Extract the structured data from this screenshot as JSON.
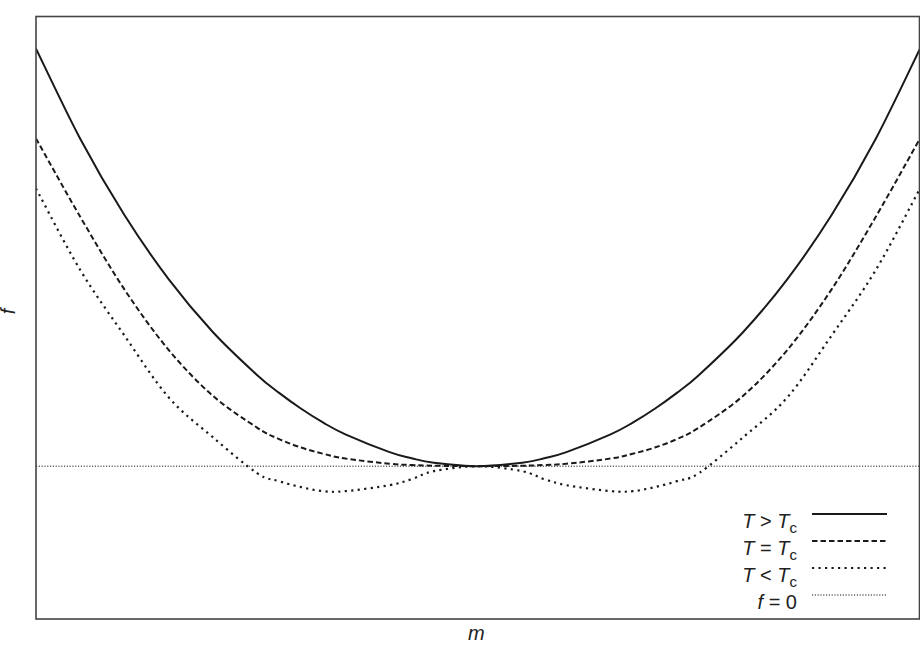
{
  "chart_data": {
    "type": "line",
    "title": "",
    "xlabel": "m",
    "ylabel": "f",
    "xlim": [
      -1.0,
      1.0
    ],
    "ylim": [
      -0.366,
      1.077
    ],
    "grid": false,
    "ticks": false,
    "legend_position": "lower right",
    "x": [
      -1.0,
      -0.9,
      -0.8,
      -0.7,
      -0.6,
      -0.5,
      -0.45,
      -0.4,
      -0.35,
      -0.3,
      -0.2,
      -0.15,
      -0.1,
      0.0,
      0.1,
      0.15,
      0.2,
      0.3,
      0.35,
      0.4,
      0.45,
      0.5,
      0.6,
      0.7,
      0.8,
      0.9,
      1.0
    ],
    "series": [
      {
        "name": "T > Tc",
        "style": "solid",
        "values": [
          1.0,
          0.7842,
          0.6014,
          0.4481,
          0.3215,
          0.2186,
          0.1755,
          0.1375,
          0.1042,
          0.0763,
          0.0336,
          0.0189,
          0.0083,
          0.0,
          0.0083,
          0.0189,
          0.0336,
          0.0763,
          0.1042,
          0.1375,
          0.1755,
          0.2186,
          0.3215,
          0.4481,
          0.6014,
          0.7842,
          1.0
        ]
      },
      {
        "name": "T = Tc",
        "style": "dashed",
        "values": [
          0.7847,
          0.5974,
          0.4234,
          0.2787,
          0.1687,
          0.0925,
          0.0649,
          0.0446,
          0.0297,
          0.0182,
          0.0058,
          0.0028,
          0.0011,
          0.0,
          0.0011,
          0.0028,
          0.0058,
          0.0182,
          0.0297,
          0.0446,
          0.0649,
          0.0925,
          0.1687,
          0.2787,
          0.4234,
          0.5974,
          0.7847
        ]
      },
      {
        "name": "T < Tc",
        "style": "dotted",
        "values": [
          0.665,
          0.47,
          0.313,
          0.165,
          0.0694,
          -0.0167,
          -0.0359,
          -0.0502,
          -0.0598,
          -0.0598,
          -0.0455,
          -0.031,
          -0.012,
          0.0,
          -0.012,
          -0.031,
          -0.0455,
          -0.0598,
          -0.0598,
          -0.0502,
          -0.0359,
          -0.0167,
          0.0694,
          0.165,
          0.313,
          0.47,
          0.665
        ]
      },
      {
        "name": "f = 0",
        "style": "fine-dotted",
        "values": [
          0,
          0,
          0,
          0,
          0,
          0,
          0,
          0,
          0,
          0,
          0,
          0,
          0,
          0,
          0,
          0,
          0,
          0,
          0,
          0,
          0,
          0,
          0,
          0,
          0,
          0,
          0
        ]
      }
    ]
  },
  "axes": {
    "xlabel": "m",
    "ylabel": "f"
  },
  "legend": {
    "items": [
      {
        "lhs": "T",
        "op": " > ",
        "rhs": "T",
        "sub": "c",
        "style": "solid"
      },
      {
        "lhs": "T",
        "op": " = ",
        "rhs": "T",
        "sub": "c",
        "style": "dashed"
      },
      {
        "lhs": "T",
        "op": " < ",
        "rhs": "T",
        "sub": "c",
        "style": "dotted"
      },
      {
        "lhs": "f",
        "op": " = 0",
        "rhs": "",
        "sub": "",
        "style": "fine-dotted"
      }
    ]
  },
  "colors": {
    "line": "#1a1a1a",
    "frame": "#444444",
    "background": "#ffffff"
  }
}
